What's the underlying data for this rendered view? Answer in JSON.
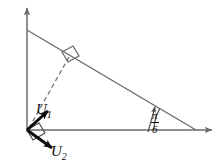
{
  "figure": {
    "background_color": "#ffffff",
    "stroke_color": "#6b6b6b",
    "vector_color": "#0d0d0d",
    "labels": {
      "u1": {
        "name": "U",
        "subscript": "1"
      },
      "u2": {
        "name": "U",
        "subscript": "2"
      },
      "angle": {
        "numerator": "π",
        "denominator": "6",
        "value_text": "π/6"
      }
    },
    "axes": {
      "y_axis": {
        "name": "vertical-axis",
        "x": 27,
        "y_top": 6,
        "y_bottom": 130
      },
      "x_axis": {
        "name": "horizontal-axis",
        "y": 130,
        "x_left": 27,
        "x_right": 214
      }
    },
    "triangle": {
      "vertex_top": [
        27,
        30
      ],
      "vertex_origin": [
        27,
        130
      ],
      "vertex_right": [
        196,
        130
      ]
    },
    "altitude": {
      "from": [
        27,
        130
      ],
      "to": [
        70,
        56
      ],
      "style": "dashed"
    },
    "right_angle_marks": [
      {
        "name": "right-angle-at-foot",
        "at": [
          70,
          56
        ]
      },
      {
        "name": "right-angle-between-vectors",
        "at": [
          27,
          130
        ]
      }
    ],
    "vectors": [
      {
        "name": "U1",
        "from": [
          27,
          130
        ],
        "to": [
          51,
          108
        ],
        "direction": "up-right"
      },
      {
        "name": "U2",
        "from": [
          27,
          130
        ],
        "to": [
          57,
          152
        ],
        "direction": "down-right"
      }
    ],
    "angle_arc": {
      "center": [
        196,
        130
      ],
      "radius": 42,
      "from_deg": 180,
      "to_deg": 150,
      "leader_arrow": true
    }
  }
}
